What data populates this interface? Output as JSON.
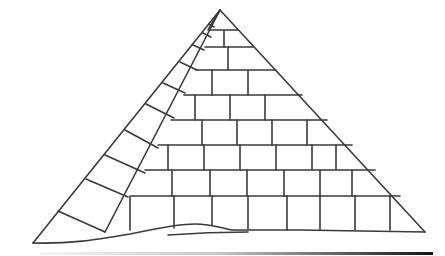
{
  "image": {
    "title": "Pyramid line drawing",
    "description": "Black-and-white line illustration of a stone-block pyramid on a desert sand dune",
    "colors": {
      "line": "#3a3a3a",
      "background": "#ffffff",
      "ground_bar_start": "#f5f5f5",
      "ground_bar_end": "#111111"
    }
  },
  "pyramid": {
    "apex": [
      220,
      10
    ],
    "left_base": [
      33,
      243
    ],
    "inner_left_base": [
      105,
      232
    ],
    "right_base": [
      425,
      232
    ],
    "course_rows_y": [
      30,
      47,
      70,
      95,
      120,
      145,
      170,
      196,
      230
    ],
    "side_face_rungs": 8,
    "front_face_courses": 9
  },
  "ground": {
    "sand_dune": true,
    "gradient_bar": {
      "x1": 40,
      "x2": 433,
      "y": 253
    }
  }
}
